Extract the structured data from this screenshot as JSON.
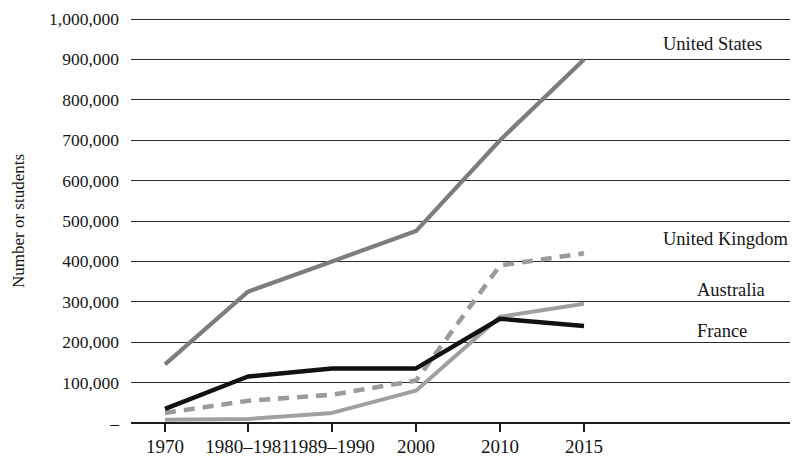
{
  "chart_data": {
    "type": "line",
    "title": "",
    "xlabel": "",
    "ylabel": "Number or students",
    "categories": [
      "1970",
      "1980–1981",
      "1989–1990",
      "2000",
      "2010",
      "2015"
    ],
    "ylim": [
      0,
      1000000
    ],
    "ytick_labels": [
      "1,000,000",
      "900,000",
      "800,000",
      "700,000",
      "600,000",
      "500,000",
      "400,000",
      "300,000",
      "200,000",
      "100,000",
      "–"
    ],
    "ytick_values": [
      1000000,
      900000,
      800000,
      700000,
      600000,
      500000,
      400000,
      300000,
      200000,
      100000,
      0
    ],
    "grid": true,
    "legend_position": "right-inline-labels",
    "series": [
      {
        "name": "United States",
        "values": [
          145000,
          325000,
          400000,
          475000,
          700000,
          900000
        ],
        "color": "#7d7d7d",
        "style": "solid",
        "width": 4.2,
        "label_x": 663,
        "label_y": 50
      },
      {
        "name": "United Kingdom",
        "values": [
          25000,
          55000,
          70000,
          105000,
          390000,
          420000
        ],
        "color": "#9b9b9b",
        "style": "dashed",
        "width": 4.6,
        "label_x": 663,
        "label_y": 245
      },
      {
        "name": "Australia",
        "values": [
          8000,
          10000,
          25000,
          80000,
          263000,
          295000
        ],
        "color": "#a0a0a0",
        "style": "solid",
        "width": 4.0,
        "label_x": 697,
        "label_y": 296
      },
      {
        "name": "France",
        "values": [
          35000,
          115000,
          135000,
          135000,
          258000,
          240000
        ],
        "color": "#111111",
        "style": "solid",
        "width": 4.4,
        "label_x": 697,
        "label_y": 337
      }
    ]
  },
  "axes": {
    "plot_left": 131,
    "plot_right": 790,
    "plot_top": 19,
    "plot_bottom": 423,
    "tick_x": [
      165,
      248,
      332,
      416,
      500,
      584
    ]
  }
}
